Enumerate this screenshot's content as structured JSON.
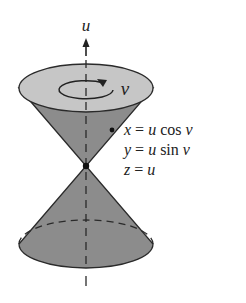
{
  "figure": {
    "axis_label": "u",
    "rotation_label": "v",
    "equations": [
      {
        "lhs": "x",
        "eq": " = ",
        "rhs_var": "u",
        "rhs_fn": " cos ",
        "rhs_arg": "v"
      },
      {
        "lhs": "y",
        "eq": " = ",
        "rhs_var": "u",
        "rhs_fn": " sin ",
        "rhs_arg": "v"
      },
      {
        "lhs": "z",
        "eq": " = ",
        "rhs_var": "u",
        "rhs_fn": "",
        "rhs_arg": ""
      }
    ],
    "colors": {
      "cap": "#c6c6c6",
      "cone": "#8c8c8c",
      "outline": "#2a2a2a",
      "background": "#ffffff"
    }
  }
}
